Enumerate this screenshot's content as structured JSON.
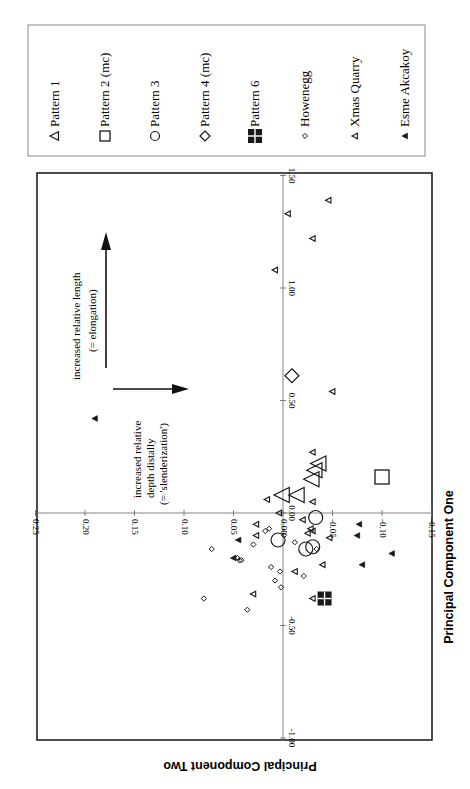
{
  "chart_data": {
    "type": "scatter",
    "orientation": "rotated-90-clockwise-page",
    "title": "",
    "xlabel": "Principal Component One",
    "ylabel": "Principal Component Two",
    "xlim": [
      -1.0,
      1.5
    ],
    "ylim": [
      -0.15,
      0.25
    ],
    "x_ticks": [
      "-1.00",
      "-0.50",
      "0.00",
      "0.50",
      "1.00",
      "1.50"
    ],
    "x_tick_values": [
      -1.0,
      -0.5,
      0.0,
      0.5,
      1.0,
      1.5
    ],
    "y_ticks": [
      "-0.15",
      "-0.10",
      "-0.05",
      "0.00",
      "0.05",
      "0.10",
      "0.15",
      "0.20",
      "0.25"
    ],
    "y_tick_values": [
      -0.15,
      -0.1,
      -0.05,
      0.0,
      0.05,
      0.1,
      0.15,
      0.2,
      0.25
    ],
    "grid": false,
    "legend_position": "right",
    "annotations": [
      {
        "text_lines": [
          "increased relative length",
          "(= elongation)"
        ],
        "arrow": "along +PC1"
      },
      {
        "text_lines": [
          "increased relative",
          "depth distally",
          "(= 'slenderization')"
        ],
        "arrow": "along +PC2"
      }
    ],
    "series": [
      {
        "name": "Pattern 1",
        "marker": "open-triangle-large",
        "points": [
          [
            0.08,
            0.0
          ],
          [
            0.08,
            -0.015
          ],
          [
            0.15,
            -0.03
          ],
          [
            0.19,
            -0.033
          ],
          [
            0.22,
            -0.037
          ]
        ]
      },
      {
        "name": "Pattern 2 (mc)",
        "marker": "open-square-large",
        "points": [
          [
            0.16,
            -0.1
          ]
        ]
      },
      {
        "name": "Pattern 3",
        "marker": "open-circle-large",
        "points": [
          [
            -0.02,
            -0.033
          ],
          [
            -0.12,
            0.005
          ],
          [
            -0.16,
            -0.023
          ],
          [
            -0.15,
            -0.03
          ]
        ]
      },
      {
        "name": "Pattern 4 (mc)",
        "marker": "open-diamond-large",
        "points": [
          [
            0.61,
            -0.009
          ]
        ]
      },
      {
        "name": "Pattern 6",
        "marker": "filled-cross-square",
        "points": [
          [
            -0.38,
            -0.042
          ]
        ]
      },
      {
        "name": "Howenegg",
        "marker": "small-open-diamond",
        "points": [
          [
            -0.16,
            0.072
          ],
          [
            -0.2,
            0.046
          ],
          [
            -0.21,
            0.044
          ],
          [
            -0.21,
            0.042
          ],
          [
            -0.08,
            0.018
          ],
          [
            -0.07,
            0.014
          ],
          [
            -0.14,
            0.03
          ],
          [
            -0.3,
            0.008
          ],
          [
            -0.26,
            0.003
          ],
          [
            -0.24,
            0.012
          ],
          [
            -0.33,
            0.002
          ],
          [
            -0.43,
            0.036
          ],
          [
            -0.1,
            -0.001
          ],
          [
            -0.28,
            -0.021
          ],
          [
            -0.13,
            -0.012
          ],
          [
            -0.16,
            -0.034
          ],
          [
            -0.38,
            0.08
          ]
        ]
      },
      {
        "name": "Xmas Quarry",
        "marker": "small-open-triangle",
        "points": [
          [
            1.39,
            -0.046
          ],
          [
            1.33,
            -0.005
          ],
          [
            1.22,
            -0.03
          ],
          [
            1.08,
            0.008
          ],
          [
            0.54,
            -0.05
          ],
          [
            0.27,
            -0.03
          ],
          [
            0.05,
            -0.03
          ],
          [
            0.0,
            0.004
          ],
          [
            -0.05,
            0.027
          ],
          [
            -0.03,
            -0.02
          ],
          [
            -0.09,
            -0.025
          ],
          [
            -0.08,
            -0.03
          ],
          [
            -0.07,
            -0.028
          ],
          [
            -0.11,
            -0.047
          ],
          [
            -0.23,
            -0.04
          ],
          [
            -0.38,
            -0.03
          ],
          [
            -0.26,
            -0.012
          ],
          [
            -0.36,
            0.03
          ],
          [
            0.06,
            0.016
          ],
          [
            -0.1,
            0.027
          ]
        ]
      },
      {
        "name": "Esme Akcakoy",
        "marker": "small-filled-triangle",
        "points": [
          [
            0.42,
            0.19
          ],
          [
            -0.1,
            -0.075
          ],
          [
            -0.18,
            -0.11
          ],
          [
            -0.23,
            -0.08
          ],
          [
            -0.05,
            -0.077
          ],
          [
            -0.12,
            0.045
          ],
          [
            -0.2,
            0.05
          ]
        ]
      }
    ]
  },
  "legend": {
    "items": [
      {
        "label": "Pattern 1",
        "marker": "open-triangle"
      },
      {
        "label": "Pattern 2 (mc)",
        "marker": "open-square"
      },
      {
        "label": "Pattern 3",
        "marker": "open-circle"
      },
      {
        "label": "Pattern 4 (mc)",
        "marker": "open-diamond"
      },
      {
        "label": "Pattern 6",
        "marker": "filled-cross-square"
      },
      {
        "label": "Howenegg",
        "marker": "small-diamond"
      },
      {
        "label": "Xmas Quarry",
        "marker": "small-open-triangle"
      },
      {
        "label": "Esme Akcakoy",
        "marker": "small-filled-triangle"
      }
    ]
  },
  "axes": {
    "x_title": "Principal Component One",
    "y_title": "Principal Component Two"
  },
  "annotations": {
    "length_line1": "increased relative length",
    "length_line2": "(= elongation)",
    "depth_line1": "increased relative",
    "depth_line2": "depth distally",
    "depth_line3": "(= 'slenderization')"
  },
  "colors": {
    "ink": "#1a1a1a",
    "axis": "#555555",
    "frame": "#222222",
    "legend_border": "#888888"
  }
}
